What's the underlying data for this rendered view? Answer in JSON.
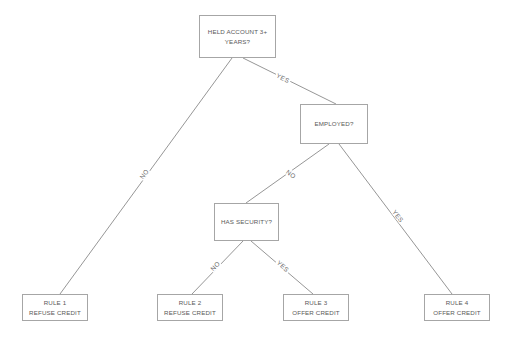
{
  "diagram": {
    "colors": {
      "background": "#ffffff",
      "node_border": "#a6a6a6",
      "node_fill": "#ffffff",
      "edge_line": "#8a8a8a",
      "text": "#595959",
      "edge_label_text": "#6b6b6b"
    },
    "nodes": [
      {
        "id": "root",
        "label": "HELD ACCOUNT 3+\nYEARS?",
        "x": 199,
        "y": 15,
        "w": 77,
        "h": 43
      },
      {
        "id": "employed",
        "label": "EMPLOYED?",
        "x": 300,
        "y": 104,
        "w": 68,
        "h": 40
      },
      {
        "id": "security",
        "label": "HAS SECURITY?",
        "x": 214,
        "y": 203,
        "w": 65,
        "h": 38
      },
      {
        "id": "rule1",
        "label": "RULE 1\nREFUSE CREDIT",
        "x": 22,
        "y": 294,
        "w": 66,
        "h": 27
      },
      {
        "id": "rule2",
        "label": "RULE 2\nREFUSE CREDIT",
        "x": 157,
        "y": 294,
        "w": 66,
        "h": 27
      },
      {
        "id": "rule3",
        "label": "RULE 3\nOFFER CREDIT",
        "x": 283,
        "y": 294,
        "w": 66,
        "h": 27
      },
      {
        "id": "rule4",
        "label": "RULE 4\nOFFER CREDIT",
        "x": 424,
        "y": 294,
        "w": 66,
        "h": 27
      }
    ],
    "edges": [
      {
        "id": "root-no",
        "from": "root",
        "to": "rule1",
        "label": "NO",
        "x1": 232,
        "y1": 58,
        "x2": 60,
        "y2": 294,
        "label_x": 144,
        "label_y": 174,
        "label_rotation": -54
      },
      {
        "id": "root-yes",
        "from": "root",
        "to": "employed",
        "label": "YES",
        "x1": 243,
        "y1": 58,
        "x2": 336,
        "y2": 104,
        "label_x": 283,
        "label_y": 78,
        "label_rotation": 27
      },
      {
        "id": "employed-no",
        "from": "employed",
        "to": "security",
        "label": "NO",
        "x1": 329,
        "y1": 144,
        "x2": 246,
        "y2": 203,
        "label_x": 291,
        "label_y": 174,
        "label_rotation": 36
      },
      {
        "id": "employed-yes",
        "from": "employed",
        "to": "rule4",
        "label": "YES",
        "x1": 339,
        "y1": 144,
        "x2": 452,
        "y2": 294,
        "label_x": 398,
        "label_y": 216,
        "label_rotation": 53
      },
      {
        "id": "security-no",
        "from": "security",
        "to": "rule2",
        "label": "NO",
        "x1": 243,
        "y1": 241,
        "x2": 192,
        "y2": 294,
        "label_x": 215,
        "label_y": 266,
        "label_rotation": -46
      },
      {
        "id": "security-yes",
        "from": "security",
        "to": "rule3",
        "label": "YES",
        "x1": 251,
        "y1": 241,
        "x2": 313,
        "y2": 294,
        "label_x": 283,
        "label_y": 266,
        "label_rotation": 41
      }
    ]
  }
}
